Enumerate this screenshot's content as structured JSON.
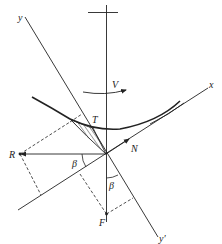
{
  "diagram": {
    "type": "force-diagram",
    "labels": {
      "y_axis": "y",
      "y_prime_axis": "y′",
      "x_axis": "x",
      "velocity": "V",
      "tangential_force": "T",
      "normal_force": "N",
      "resultant_force": "R",
      "force_F": "F",
      "angle_beta_left": "β",
      "angle_beta_lower": "β"
    },
    "colors": {
      "line": "#222222",
      "background": "#ffffff"
    }
  }
}
